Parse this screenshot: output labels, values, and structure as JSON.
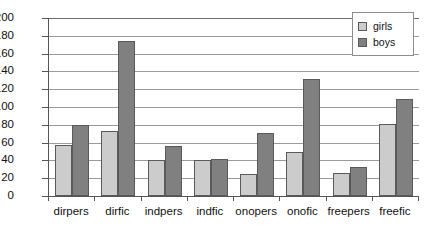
{
  "chart_data": {
    "type": "bar",
    "title": "",
    "subtitle": "",
    "xlabel": "",
    "ylabel": "",
    "ylim": [
      0,
      200
    ],
    "ytick_step": 20,
    "yticks": [
      200,
      180,
      160,
      140,
      120,
      100,
      80,
      60,
      40,
      20,
      0
    ],
    "grid": true,
    "grid_axis": "y",
    "legend_position": "top-right",
    "categories": [
      "dirpers",
      "dirfic",
      "indpers",
      "indfic",
      "onopers",
      "onofic",
      "freepers",
      "freefic"
    ],
    "series": [
      {
        "name": "girls",
        "color": "#cccccc",
        "values": [
          57,
          73,
          40,
          40,
          25,
          49,
          26,
          81
        ]
      },
      {
        "name": "boys",
        "color": "#808080",
        "values": [
          80,
          174,
          56,
          42,
          71,
          131,
          33,
          109
        ]
      }
    ]
  },
  "legend": {
    "items": [
      {
        "label": "girls",
        "swatch_icon": "legend-swatch-icon"
      },
      {
        "label": "boys",
        "swatch_icon": "legend-swatch-icon"
      }
    ]
  },
  "colors": {
    "girls": "#cccccc",
    "boys": "#808080",
    "axis": "#555555",
    "gridline": "#9a9a9a",
    "background": "#ffffff",
    "text": "#111111"
  }
}
